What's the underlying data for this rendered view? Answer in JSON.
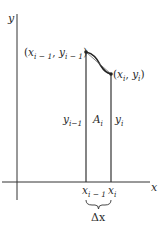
{
  "diagram": {
    "axes": {
      "x_label": "x",
      "y_label": "y"
    },
    "points": {
      "left": {
        "label_x": "x",
        "label_x_sub": "i − 1",
        "label_y": "y",
        "label_y_sub": "i − 1"
      },
      "right": {
        "label_x": "x",
        "label_x_sub": "i",
        "label_y": "y",
        "label_y_sub": "i"
      }
    },
    "strip": {
      "left_height_label": "y",
      "left_height_sub": "i−1",
      "area_label": "A",
      "area_sub": "i",
      "right_height_label": "y",
      "right_height_sub": "i"
    },
    "ticks": {
      "left": {
        "base": "x",
        "sub": "i − 1"
      },
      "right": {
        "base": "x",
        "sub": "i"
      }
    },
    "width_label": "Δx",
    "colors": {
      "line": "#2a2a2a",
      "background": "#ffffff"
    }
  }
}
